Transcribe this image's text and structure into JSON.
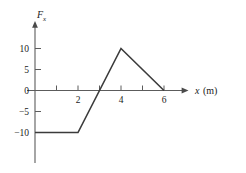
{
  "figure": {
    "background_color": "#ffffff",
    "line_color": "#3b3b3b",
    "axis_color": "#5c5c5c",
    "text_color": "#1a1a1a"
  },
  "axis": {
    "y_title_main": "F",
    "y_title_sub": "x",
    "x_title_main": "x",
    "x_title_unit": "(m)"
  },
  "ticks": {
    "y_labels": [
      "10",
      "5",
      "0",
      "−5",
      "−10"
    ],
    "y_values": [
      10,
      5,
      0,
      -5,
      -10
    ],
    "x_labels": [
      "2",
      "4",
      "6"
    ],
    "x_label_values": [
      2,
      4,
      6
    ],
    "x_tick_values": [
      1,
      2,
      3,
      4,
      5,
      6
    ]
  },
  "chart_data": {
    "type": "line",
    "title": "",
    "subtitle": "",
    "xlabel": "x (m)",
    "ylabel": "Fx",
    "xlim": [
      0,
      6.9
    ],
    "ylim": [
      -13.5,
      12
    ],
    "grid": false,
    "legend": null,
    "x": [
      0,
      2,
      4,
      6
    ],
    "y": [
      -10,
      -10,
      10,
      0
    ],
    "series": [
      {
        "name": "Fx",
        "points": [
          {
            "x": 0,
            "y": -10
          },
          {
            "x": 2,
            "y": -10
          },
          {
            "x": 4,
            "y": 10
          },
          {
            "x": 6,
            "y": 0
          }
        ]
      }
    ],
    "annotations": [
      {
        "text": "zero crossing",
        "x": 3,
        "y": 0
      }
    ],
    "xticks": [
      1,
      2,
      3,
      4,
      5,
      6
    ],
    "xticklabels": [
      "",
      "2",
      "",
      "4",
      "",
      "6"
    ],
    "yticks": [
      -10,
      -5,
      0,
      5,
      10
    ],
    "yticklabels": [
      "−10",
      "−5",
      "0",
      "5",
      "10"
    ]
  }
}
